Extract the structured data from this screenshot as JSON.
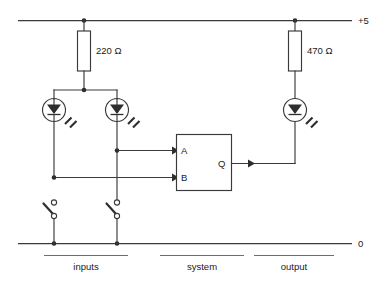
{
  "diagram": {
    "rails": {
      "supply_label": "+5",
      "ground_label": "0"
    },
    "components": {
      "resistor_input": {
        "label": "220 Ω",
        "value": "220",
        "unit": "Ω"
      },
      "resistor_output": {
        "label": "470 Ω",
        "value": "470",
        "unit": "Ω"
      },
      "gate": {
        "input_a_label": "A",
        "input_b_label": "B",
        "output_label": "Q"
      },
      "leds": [
        {
          "name": "input-a-led"
        },
        {
          "name": "input-b-led"
        },
        {
          "name": "output-led"
        }
      ],
      "switches": [
        {
          "name": "switch-a",
          "state": "open"
        },
        {
          "name": "switch-b",
          "state": "open"
        }
      ]
    },
    "sections": [
      {
        "label": "inputs"
      },
      {
        "label": "system"
      },
      {
        "label": "output"
      }
    ],
    "colors": {
      "line": "#3a3a3a",
      "fill_dark": "#2e2e2e",
      "bracket": "#6d6d6d",
      "background": "#ffffff"
    }
  }
}
